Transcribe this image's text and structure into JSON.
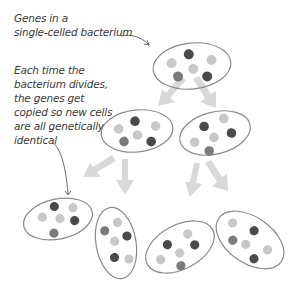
{
  "diagram": {
    "labels": [
      {
        "lines": [
          "Genes in a",
          "single-celled bacterium"
        ]
      },
      {
        "lines": [
          "Each time the",
          "bacterium divides,",
          "the genes get",
          "copied so new cells",
          "are all genetically",
          "identical"
        ]
      }
    ],
    "colors": {
      "outline": "#8a8a8a",
      "arrow": "#d6d6d6",
      "gene_dark": "#4a4a4a",
      "gene_mid": "#7a7a7a",
      "gene_light": "#c8c8c8",
      "text": "#3a3a3a"
    },
    "generations": [
      {
        "level": 1,
        "cells": 1
      },
      {
        "level": 2,
        "cells": 2
      },
      {
        "level": 3,
        "cells": 4
      }
    ]
  }
}
